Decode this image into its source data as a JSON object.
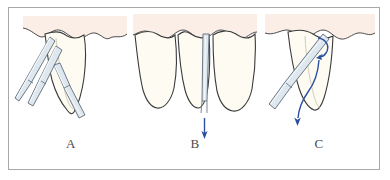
{
  "figure": {
    "frame_color": "#a8a8a8",
    "background_color": "#ffffff",
    "panel_count": 3
  },
  "colors": {
    "tooth_fill": "#fdfbf2",
    "tooth_outline": "#3a3a3a",
    "gingiva_fill": "#fbeee6",
    "gingiva_outline": "#4a4a4a",
    "instrument_fill": "#dfe7ee",
    "instrument_highlight": "#f4f8fb",
    "instrument_outline": "#5b6b7a",
    "arrow_color": "#2b4fa0",
    "label_color": "#4a4a4a"
  },
  "panels": [
    {
      "id": "a",
      "label": "A",
      "caption": "Luxation of tooth with straight elevators applied from facial aspect",
      "tooth_count": 1,
      "instrument_count": 3,
      "instrument_name": "straight-elevator",
      "arrows": []
    },
    {
      "id": "b",
      "label": "B",
      "caption": "Thin elevator blade inserted into interdental space; apical force applied",
      "tooth_count": 3,
      "instrument_count": 1,
      "instrument_name": "thin-elevator-blade",
      "arrows": [
        {
          "type": "straight",
          "direction": "down",
          "label": "apical-force-arrow"
        }
      ]
    },
    {
      "id": "c",
      "label": "C",
      "caption": "Rotational and downward delivery of the tooth with elevator",
      "tooth_count": 1,
      "instrument_count": 1,
      "instrument_name": "elevator",
      "arrows": [
        {
          "type": "curved-hook",
          "direction": "rotational",
          "label": "rotation-arrow"
        },
        {
          "type": "curved-long",
          "direction": "down-out",
          "label": "delivery-arrow"
        }
      ]
    }
  ]
}
